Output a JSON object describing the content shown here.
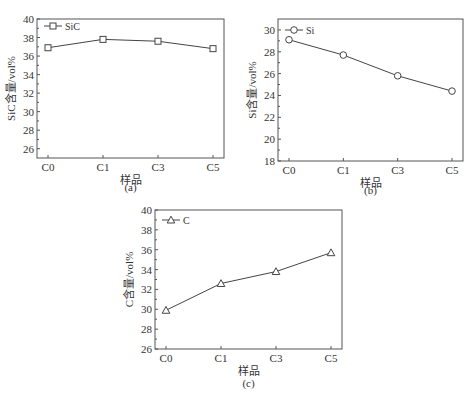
{
  "chart_data": [
    {
      "type": "line",
      "panel": "(a)",
      "title": "",
      "xlabel": "样品",
      "ylabel": "SiC含量/vol%",
      "categories": [
        "C0",
        "C1",
        "C3",
        "C5"
      ],
      "series": [
        {
          "name": "SiC",
          "marker": "square",
          "values": [
            36.9,
            37.8,
            37.6,
            36.8
          ]
        }
      ],
      "ylim": [
        25,
        40
      ],
      "yticks": [
        26,
        28,
        30,
        32,
        34,
        36,
        38,
        40
      ],
      "legend_position": "upper left",
      "grid": false
    },
    {
      "type": "line",
      "panel": "(b)",
      "title": "",
      "xlabel": "样品",
      "ylabel": "Si含量/vol%",
      "categories": [
        "C0",
        "C1",
        "C3",
        "C5"
      ],
      "series": [
        {
          "name": "Si",
          "marker": "circle",
          "values": [
            29.1,
            27.7,
            25.8,
            24.4
          ]
        }
      ],
      "ylim": [
        18,
        31
      ],
      "yticks": [
        18,
        20,
        22,
        24,
        26,
        28,
        30
      ],
      "legend_position": "upper left",
      "grid": false
    },
    {
      "type": "line",
      "panel": "(c)",
      "title": "",
      "xlabel": "样品",
      "ylabel": "C含量/vol%",
      "categories": [
        "C0",
        "C1",
        "C3",
        "C5"
      ],
      "series": [
        {
          "name": "C",
          "marker": "triangle",
          "values": [
            29.9,
            32.6,
            33.8,
            35.7
          ]
        }
      ],
      "ylim": [
        26,
        40
      ],
      "yticks": [
        26,
        28,
        30,
        32,
        34,
        36,
        38,
        40
      ],
      "legend_position": "upper left",
      "grid": false
    }
  ],
  "layout": [
    {
      "box": [
        37,
        19,
        224,
        158
      ],
      "legend_xy": [
        44,
        26
      ],
      "caption_y": 191
    },
    {
      "box": [
        278,
        19,
        463,
        161
      ],
      "legend_xy": [
        285,
        30
      ],
      "caption_y": 194
    },
    {
      "box": [
        155,
        210,
        342,
        349
      ],
      "legend_xy": [
        162,
        220
      ],
      "caption_y": 387
    }
  ]
}
